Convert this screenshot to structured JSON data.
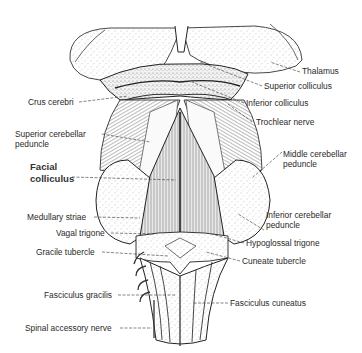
{
  "figure": {
    "labels_left": [
      {
        "id": "crus-cerebri",
        "text": "Crus cerebri"
      },
      {
        "id": "superior-cerebellar-peduncle",
        "line1": "Superior cerebellar",
        "line2": "peduncle"
      },
      {
        "id": "facial-colliculus",
        "line1": "Facial",
        "line2": "colliculus"
      },
      {
        "id": "medullary-striae",
        "text": "Medullary striae"
      },
      {
        "id": "vagal-trigone",
        "text": "Vagal trigone"
      },
      {
        "id": "gracile-tubercle",
        "text": "Gracile tubercle"
      },
      {
        "id": "fasciculus-gracilis",
        "text": "Fasciculus gracilis"
      },
      {
        "id": "spinal-accessory-nerve",
        "text": "Spinal accessory nerve"
      }
    ],
    "labels_right": [
      {
        "id": "thalamus",
        "text": "Thalamus"
      },
      {
        "id": "superior-colliculus",
        "text": "Superior colliculus"
      },
      {
        "id": "inferior-colliculus",
        "text": "Inferior colliculus"
      },
      {
        "id": "trochlear-nerve",
        "text": "Trochlear nerve"
      },
      {
        "id": "middle-cerebellar-peduncle",
        "line1": "Middle cerebellar",
        "line2": "peduncle"
      },
      {
        "id": "inferior-cerebellar-peduncle",
        "line1": "Inferior cerebellar",
        "line2": "peduncle"
      },
      {
        "id": "hypoglossal-trigone",
        "text": "Hypoglossal trigone"
      },
      {
        "id": "cuneate-tubercle",
        "text": "Cuneate tubercle"
      },
      {
        "id": "fasciculus-cuneatus",
        "text": "Fasciculus cuneatus"
      }
    ]
  }
}
